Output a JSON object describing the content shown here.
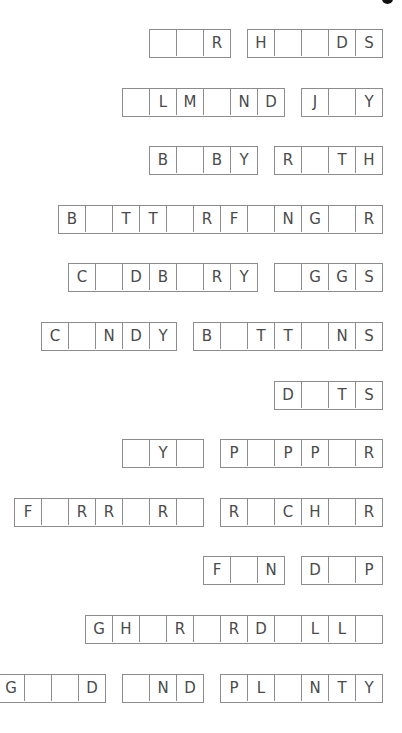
{
  "worksheet": {
    "cutoff_glyph": "g",
    "rows": [
      {
        "words": [
          [
            "",
            "",
            "R"
          ],
          [
            "H",
            "",
            "",
            "D",
            "S"
          ]
        ]
      },
      {
        "words": [
          [
            "",
            "L",
            "M",
            "",
            "N",
            "D"
          ],
          [
            "J",
            "",
            "Y"
          ]
        ]
      },
      {
        "words": [
          [
            "B",
            "",
            "B",
            "Y"
          ],
          [
            "R",
            "",
            "T",
            "H"
          ]
        ]
      },
      {
        "words": [
          [
            "B",
            "",
            "T",
            "T",
            "",
            "R",
            "F",
            "",
            "N",
            "G",
            "",
            "R"
          ]
        ]
      },
      {
        "words": [
          [
            "C",
            "",
            "D",
            "B",
            "",
            "R",
            "Y"
          ],
          [
            "",
            "G",
            "G",
            "S"
          ]
        ]
      },
      {
        "words": [
          [
            "C",
            "",
            "N",
            "D",
            "Y"
          ],
          [
            "B",
            "",
            "T",
            "T",
            "",
            "N",
            "S"
          ]
        ]
      },
      {
        "words": [
          [
            "D",
            "",
            "T",
            "S"
          ]
        ]
      },
      {
        "words": [
          [
            "",
            "Y",
            ""
          ],
          [
            "P",
            "",
            "P",
            "P",
            "",
            "R"
          ]
        ]
      },
      {
        "words": [
          [
            "F",
            "",
            "R",
            "R",
            "",
            "R",
            ""
          ],
          [
            "R",
            "",
            "C",
            "H",
            "",
            "R"
          ]
        ]
      },
      {
        "words": [
          [
            "F",
            "",
            "N"
          ],
          [
            "D",
            "",
            "P"
          ]
        ]
      },
      {
        "words": [
          [
            "G",
            "H",
            "",
            "R",
            "",
            "R",
            "D",
            "",
            "L",
            "L",
            ""
          ]
        ]
      },
      {
        "words": [
          [
            "G",
            "",
            "",
            "D"
          ],
          [
            "",
            "N",
            "D"
          ],
          [
            "P",
            "L",
            "",
            "N",
            "T",
            "Y"
          ]
        ]
      }
    ]
  },
  "colors": {
    "border": "#8c8c8c",
    "letter": "#4a4a4a",
    "background": "#ffffff"
  }
}
